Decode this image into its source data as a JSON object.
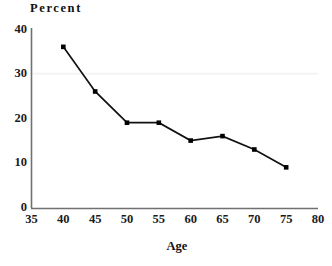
{
  "chart_data": {
    "type": "line",
    "title": "",
    "xlabel": "Age",
    "ylabel": "Percent",
    "xlim": [
      35,
      80
    ],
    "ylim": [
      0,
      40
    ],
    "grid": false,
    "legend": false,
    "marker": "square",
    "line_color": "#111111",
    "marker_color": "#000000",
    "x": [
      40,
      45,
      50,
      55,
      60,
      65,
      70,
      75
    ],
    "values": [
      36,
      26,
      19,
      19,
      15,
      16,
      13,
      9
    ],
    "xticks": [
      "35",
      "40",
      "45",
      "50",
      "55",
      "60",
      "65",
      "70",
      "75",
      "80"
    ],
    "xtick_values": [
      35,
      40,
      45,
      50,
      55,
      60,
      65,
      70,
      75,
      80
    ],
    "yticks": [
      "0",
      "10",
      "20",
      "30",
      "40"
    ],
    "ytick_values": [
      0,
      10,
      20,
      30,
      40
    ],
    "points": [
      {
        "x": 40,
        "y": 36
      },
      {
        "x": 45,
        "y": 26
      },
      {
        "x": 50,
        "y": 19
      },
      {
        "x": 55,
        "y": 19
      },
      {
        "x": 60,
        "y": 15
      },
      {
        "x": 65,
        "y": 16
      },
      {
        "x": 70,
        "y": 13
      },
      {
        "x": 75,
        "y": 9
      }
    ]
  }
}
